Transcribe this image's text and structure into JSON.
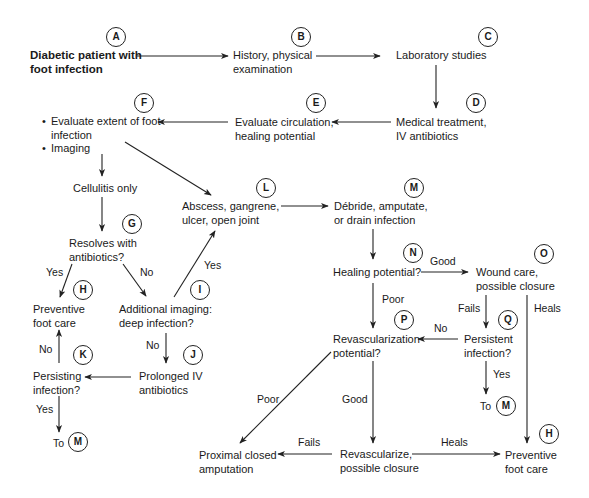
{
  "diagram": {
    "type": "flowchart",
    "topic": "Management of diabetic foot infection",
    "nodes": {
      "A": {
        "badge": "A",
        "text": "Diabetic patient with\nfoot infection"
      },
      "B": {
        "badge": "B",
        "text": "History, physical\nexamination"
      },
      "C": {
        "badge": "C",
        "text": "Laboratory studies"
      },
      "D": {
        "badge": "D",
        "text": "Medical treatment,\nIV antibiotics"
      },
      "E": {
        "badge": "E",
        "text": "Evaluate circulation,\nhealing potential"
      },
      "F": {
        "badge": "F",
        "items": [
          "Evaluate extent of foot\ninfection",
          "Imaging"
        ]
      },
      "cellulitis": {
        "text": "Cellulitis only"
      },
      "G": {
        "badge": "G",
        "text": "Resolves with\nantibiotics?"
      },
      "H1": {
        "badge": "H",
        "text": "Preventive\nfoot care"
      },
      "I": {
        "badge": "I",
        "text": "Additional imaging:\ndeep infection?"
      },
      "J": {
        "badge": "J",
        "text": "Prolonged IV\nantibiotics"
      },
      "K": {
        "badge": "K",
        "text": "Persisting\ninfection?"
      },
      "toM1": {
        "prefix": "To",
        "badge": "M"
      },
      "L": {
        "badge": "L",
        "text": "Abscess, gangrene,\nulcer, open joint"
      },
      "M": {
        "badge": "M",
        "text": "Débride, amputate,\nor drain infection"
      },
      "N": {
        "badge": "N",
        "text": "Healing potential?"
      },
      "O": {
        "badge": "O",
        "text": "Wound care,\npossible closure"
      },
      "P": {
        "badge": "P",
        "text": "Revascularization\npotential?"
      },
      "Q": {
        "badge": "Q",
        "text": "Persistent\ninfection?"
      },
      "toM2": {
        "prefix": "To",
        "badge": "M"
      },
      "amputation": {
        "text": "Proximal closed\namputation"
      },
      "revasc": {
        "text": "Revascularize,\npossible closure"
      },
      "H2": {
        "badge": "H",
        "text": "Preventive\nfoot care"
      }
    },
    "edge_labels": {
      "G_yes": "Yes",
      "G_no": "No",
      "I_yes": "Yes",
      "I_no": "No",
      "K_no": "No",
      "K_yes": "Yes",
      "N_good": "Good",
      "N_poor": "Poor",
      "O_fails": "Fails",
      "O_heals": "Heals",
      "Q_no": "No",
      "Q_yes": "Yes",
      "P_poor": "Poor",
      "P_good": "Good",
      "revasc_fails": "Fails",
      "revasc_heals": "Heals"
    },
    "edges": [
      [
        "A",
        "B"
      ],
      [
        "B",
        "C"
      ],
      [
        "C",
        "D"
      ],
      [
        "D",
        "E"
      ],
      [
        "E",
        "F"
      ],
      [
        "F",
        "cellulitis"
      ],
      [
        "F",
        "L"
      ],
      [
        "cellulitis",
        "G"
      ],
      [
        "G",
        "H1",
        "Yes"
      ],
      [
        "G",
        "I",
        "No"
      ],
      [
        "I",
        "L",
        "Yes"
      ],
      [
        "I",
        "J",
        "No"
      ],
      [
        "J",
        "K"
      ],
      [
        "K",
        "H1",
        "No"
      ],
      [
        "K",
        "toM1",
        "Yes"
      ],
      [
        "L",
        "M"
      ],
      [
        "M",
        "N"
      ],
      [
        "N",
        "O",
        "Good"
      ],
      [
        "N",
        "P",
        "Poor"
      ],
      [
        "O",
        "Q",
        "Fails"
      ],
      [
        "O",
        "H2",
        "Heals"
      ],
      [
        "Q",
        "P",
        "No"
      ],
      [
        "Q",
        "toM2",
        "Yes"
      ],
      [
        "P",
        "amputation",
        "Poor"
      ],
      [
        "P",
        "revasc",
        "Good"
      ],
      [
        "revasc",
        "amputation",
        "Fails"
      ],
      [
        "revasc",
        "H2",
        "Heals"
      ]
    ],
    "colors": {
      "line": "#222222",
      "text": "#1a1a1a",
      "background": "#ffffff"
    }
  }
}
